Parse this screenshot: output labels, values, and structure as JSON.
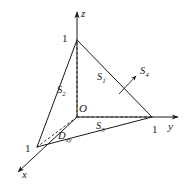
{
  "figure": {
    "type": "geometric-diagram",
    "background_color": "#ffffff",
    "line_color": "#1a1a1a",
    "axes": [
      {
        "name": "x",
        "label": "x",
        "direction": "lower-left",
        "tick_label": "1"
      },
      {
        "name": "y",
        "label": "y",
        "direction": "right",
        "tick_label": "1"
      },
      {
        "name": "z",
        "label": "z",
        "direction": "up",
        "tick_label": "1"
      }
    ],
    "origin_label": "O",
    "surfaces": [
      {
        "id": "S1",
        "letter": "S",
        "index": "1",
        "note": "front slanted face facing viewer"
      },
      {
        "id": "S2",
        "letter": "S",
        "index": "2",
        "note": "left face in the xOz plane"
      },
      {
        "id": "S3",
        "letter": "S",
        "index": "3",
        "note": "bottom face in the xOy plane"
      },
      {
        "id": "S4",
        "letter": "S",
        "index": "4",
        "note": "right slanted face with leader arrow"
      }
    ],
    "region": {
      "id": "Dxy",
      "letter": "D",
      "index": "xy",
      "note": "projection region in the xOy plane"
    },
    "tick_values": {
      "x": "1",
      "y": "1",
      "z": "1"
    }
  }
}
